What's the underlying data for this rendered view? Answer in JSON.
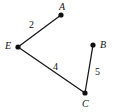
{
  "figure": {
    "type": "undirected-weighted-graph",
    "width": 118,
    "height": 112,
    "background_color": "#ffffff",
    "stroke_color": "#1a1a1a",
    "node_fill_color": "#111111"
  },
  "chart_data": {
    "type": "diagram",
    "title": "",
    "nodes": [
      {
        "id": "A",
        "label": "A",
        "x": 61,
        "y": 15,
        "label_x": 59,
        "label_y": 2
      },
      {
        "id": "B",
        "label": "B",
        "x": 93,
        "y": 45,
        "label_x": 100,
        "label_y": 40
      },
      {
        "id": "C",
        "label": "C",
        "x": 85,
        "y": 93,
        "label_x": 82,
        "label_y": 99
      },
      {
        "id": "E",
        "label": "E",
        "x": 18,
        "y": 47,
        "label_x": 5,
        "label_y": 41
      }
    ],
    "edges": [
      {
        "from": "E",
        "to": "A",
        "weight": "2",
        "label_x": 29,
        "label_y": 20
      },
      {
        "from": "E",
        "to": "C",
        "weight": "4",
        "label_x": 53,
        "label_y": 62
      },
      {
        "from": "B",
        "to": "C",
        "weight": "5",
        "label_x": 95,
        "label_y": 67
      }
    ]
  }
}
